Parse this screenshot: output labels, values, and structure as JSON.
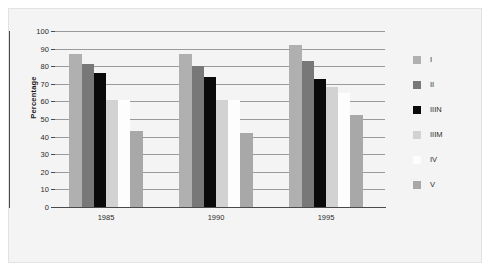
{
  "chart_data": {
    "type": "bar",
    "title": "",
    "subtitle": "",
    "xlabel": "",
    "ylabel": "Percentage",
    "categories": [
      "1985",
      "1990",
      "1995"
    ],
    "ylim": [
      0,
      100
    ],
    "yticks": [
      0,
      10,
      20,
      30,
      40,
      50,
      60,
      70,
      80,
      90,
      100
    ],
    "ytick_labels": [
      "0",
      "10",
      "20",
      "30",
      "40",
      "50",
      "60",
      "70",
      "80",
      "90",
      "100"
    ],
    "grid": true,
    "grid_axis": "y",
    "legend_position": "right",
    "series": [
      {
        "name": "I",
        "color": "#b0b0b0",
        "values": [
          87,
          87,
          92
        ]
      },
      {
        "name": "II",
        "color": "#787878",
        "values": [
          81,
          80,
          83
        ]
      },
      {
        "name": "IIIN",
        "color": "#0a0a0a",
        "values": [
          76,
          74,
          73
        ]
      },
      {
        "name": "IIIM",
        "color": "#d2d2d2",
        "values": [
          61,
          61,
          68
        ]
      },
      {
        "name": "IV",
        "color": "#fdfdfd",
        "values": [
          61,
          61,
          65
        ]
      },
      {
        "name": "V",
        "color": "#a8a8a8",
        "values": [
          43,
          42,
          52
        ]
      }
    ]
  },
  "legend": {
    "entries": [
      {
        "label": "I"
      },
      {
        "label": "II"
      },
      {
        "label": "IIIN"
      },
      {
        "label": "IIIM"
      },
      {
        "label": "IV"
      },
      {
        "label": "V"
      }
    ]
  },
  "colors": {
    "figure_background": "#f4f4f4",
    "figure_border": "#e2e2e2",
    "axis": "#4a4a4a",
    "gridline": "#9a9a9a",
    "text": "#2b2b2b"
  }
}
